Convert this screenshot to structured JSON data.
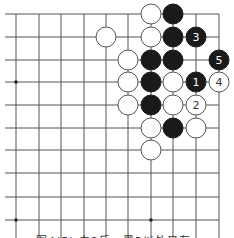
{
  "diagram": {
    "type": "go-board-fragment",
    "background": "#ffffff",
    "line_color": "#555555",
    "grid": {
      "columns_x": [
        16,
        39,
        61,
        84,
        106,
        128,
        151,
        173,
        196,
        219
      ],
      "rows_y": [
        14,
        37,
        60,
        82,
        105,
        128,
        150,
        173,
        197,
        220
      ],
      "left_extent": 5,
      "bottom_extent": 238,
      "top_edge": true,
      "right_edge": true
    },
    "star_points": [
      [
        0,
        3
      ],
      [
        0,
        9
      ],
      [
        6,
        9
      ]
    ],
    "stone_radius": 10,
    "stones": [
      {
        "col": 6,
        "row": 0,
        "color": "white",
        "label": ""
      },
      {
        "col": 7,
        "row": 0,
        "color": "black",
        "label": ""
      },
      {
        "col": 4,
        "row": 1,
        "color": "white",
        "label": ""
      },
      {
        "col": 6,
        "row": 1,
        "color": "white",
        "label": ""
      },
      {
        "col": 7,
        "row": 1,
        "color": "black",
        "label": ""
      },
      {
        "col": 8,
        "row": 1,
        "color": "black",
        "label": "3"
      },
      {
        "col": 5,
        "row": 2,
        "color": "white",
        "label": ""
      },
      {
        "col": 6,
        "row": 2,
        "color": "black",
        "label": ""
      },
      {
        "col": 7,
        "row": 2,
        "color": "black",
        "label": ""
      },
      {
        "col": 9,
        "row": 2,
        "color": "black",
        "label": "5"
      },
      {
        "col": 5,
        "row": 3,
        "color": "white",
        "label": ""
      },
      {
        "col": 6,
        "row": 3,
        "color": "black",
        "label": ""
      },
      {
        "col": 7,
        "row": 3,
        "color": "white",
        "label": ""
      },
      {
        "col": 8,
        "row": 3,
        "color": "black",
        "label": "1"
      },
      {
        "col": 9,
        "row": 3,
        "color": "white",
        "label": "4"
      },
      {
        "col": 5,
        "row": 4,
        "color": "white",
        "label": ""
      },
      {
        "col": 6,
        "row": 4,
        "color": "black",
        "label": ""
      },
      {
        "col": 7,
        "row": 4,
        "color": "white",
        "label": ""
      },
      {
        "col": 8,
        "row": 4,
        "color": "white",
        "label": "2"
      },
      {
        "col": 6,
        "row": 5,
        "color": "white",
        "label": ""
      },
      {
        "col": 7,
        "row": 5,
        "color": "black",
        "label": ""
      },
      {
        "col": 8,
        "row": 5,
        "color": "white",
        "label": ""
      },
      {
        "col": 6,
        "row": 6,
        "color": "white",
        "label": ""
      }
    ],
    "colors": {
      "black_stone": "#1a1a1a",
      "white_stone": "#ffffff",
      "stone_outline": "#555555",
      "label_on_black": "#ffffff",
      "label_on_white": "#333333"
    },
    "caption": "图4(5)  白2后，黑3以外只有……"
  }
}
